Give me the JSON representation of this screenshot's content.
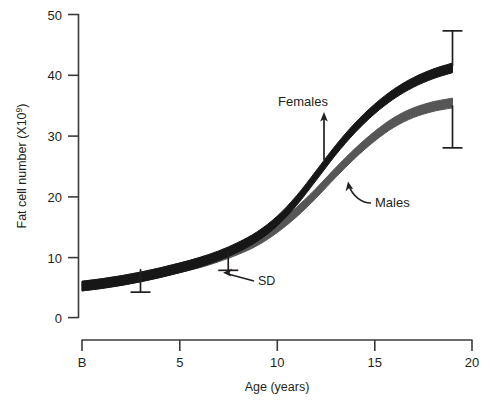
{
  "chart_data": {
    "type": "line",
    "title": "",
    "xlabel": "Age (years)",
    "ylabel": "Fat cell number (X10⁹)",
    "ylabel_base": "Fat cell number (X10",
    "ylabel_sup": "9",
    "ylabel_tail": ")",
    "xlim": [
      0,
      20
    ],
    "ylim": [
      0,
      50
    ],
    "grid": false,
    "legend_position": "inline-annotation",
    "x_tick_labels": [
      "B",
      "5",
      "10",
      "15",
      "20"
    ],
    "x_tick_values": [
      0,
      5,
      10,
      15,
      20
    ],
    "y_tick_labels": [
      "0",
      "10",
      "20",
      "30",
      "40",
      "50"
    ],
    "y_tick_values": [
      0,
      10,
      20,
      30,
      40,
      50
    ],
    "series": [
      {
        "name": "Females",
        "color": "#171717",
        "band_width_units": 1.6,
        "x": [
          0,
          1,
          2,
          3,
          4,
          5,
          6,
          7,
          8,
          9,
          10,
          11,
          12,
          13,
          14,
          15,
          16,
          17,
          18,
          19
        ],
        "values": [
          5.2,
          5.6,
          6.1,
          6.7,
          7.4,
          8.2,
          9.1,
          10.2,
          11.6,
          13.4,
          15.9,
          19.3,
          23.4,
          27.6,
          31.3,
          34.4,
          36.9,
          38.8,
          40.2,
          41.2
        ]
      },
      {
        "name": "Males",
        "color": "#565656",
        "band_width_units": 1.6,
        "x": [
          0,
          1,
          2,
          3,
          4,
          5,
          6,
          7,
          8,
          9,
          10,
          11,
          12,
          13,
          14,
          15,
          16,
          17,
          18,
          19
        ],
        "values": [
          5.2,
          5.6,
          6.1,
          6.7,
          7.4,
          8.2,
          9.0,
          10.0,
          11.2,
          12.7,
          14.8,
          17.4,
          20.5,
          23.9,
          27.1,
          29.9,
          32.2,
          33.8,
          34.8,
          35.4
        ]
      }
    ],
    "error_bars": [
      {
        "name": "sd-bar-left",
        "x": 3.0,
        "from": 8.0,
        "to": 4.2,
        "direction": "down"
      },
      {
        "name": "sd-bar-mid",
        "x": 7.5,
        "from": 11.0,
        "to": 7.8,
        "direction": "down"
      },
      {
        "name": "sd-bar-females-right",
        "x": 19.0,
        "from": 41.5,
        "to": 47.3,
        "direction": "up"
      },
      {
        "name": "sd-bar-males-right",
        "x": 19.0,
        "from": 35.0,
        "to": 28.0,
        "direction": "down"
      }
    ],
    "annotations": [
      {
        "name": "females-annotation",
        "text": "Females",
        "x": 12.0,
        "y": 33.2,
        "arrow": "up"
      },
      {
        "name": "males-annotation",
        "text": "Males",
        "x": 15.4,
        "y": 20.2,
        "arrow": "curved-left"
      },
      {
        "name": "sd-annotation",
        "text": "SD",
        "x": 9.4,
        "y": 9.0,
        "arrow": "left"
      }
    ]
  }
}
